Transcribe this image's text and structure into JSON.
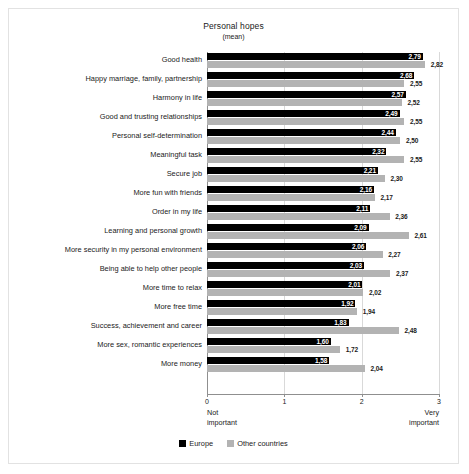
{
  "chart_data": {
    "type": "bar",
    "orientation": "horizontal",
    "title": "Personal hopes",
    "subtitle": "(mean)",
    "xlabel": "",
    "ylabel": "",
    "xlim": [
      0,
      3
    ],
    "xticks": [
      "0",
      "1",
      "2",
      "3"
    ],
    "grid": true,
    "legend_position": "bottom",
    "axis_anchor_low": "Not\nimportant",
    "axis_anchor_low_line1": "Not",
    "axis_anchor_low_line2": "important",
    "axis_anchor_high_line1": "Very",
    "axis_anchor_high_line2": "important",
    "categories": [
      "Good health",
      "Happy marriage, family, partnership",
      "Harmony in life",
      "Good and trusting relationships",
      "Personal self-determination",
      "Meaningful task",
      "Secure job",
      "More fun with friends",
      "Order in my life",
      "Learning and personal growth",
      "More security in my personal environment",
      "Being able to help other people",
      "More time to relax",
      "More free time",
      "Success, achievement and career",
      "More sex, romantic experiences",
      "More money"
    ],
    "series": [
      {
        "name": "Europe",
        "color": "#000000",
        "values": [
          2.79,
          2.68,
          2.57,
          2.49,
          2.44,
          2.32,
          2.21,
          2.16,
          2.11,
          2.09,
          2.06,
          2.03,
          2.01,
          1.92,
          1.83,
          1.6,
          1.58
        ],
        "labels": [
          "2,79",
          "2,68",
          "2,57",
          "2,49",
          "2,44",
          "2,32",
          "2,21",
          "2,16",
          "2,11",
          "2,09",
          "2,06",
          "2,03",
          "2,01",
          "1,92",
          "1,83",
          "1,60",
          "1,58"
        ]
      },
      {
        "name": "Other countries",
        "color": "#b3b3b3",
        "values": [
          2.82,
          2.55,
          2.52,
          2.55,
          2.5,
          2.55,
          2.3,
          2.17,
          2.36,
          2.61,
          2.27,
          2.37,
          2.02,
          1.94,
          2.48,
          1.72,
          2.04
        ],
        "labels": [
          "2,82",
          "2,55",
          "2,52",
          "2,55",
          "2,50",
          "2,55",
          "2,30",
          "2,17",
          "2,36",
          "2,61",
          "2,27",
          "2,37",
          "2,02",
          "1,94",
          "2,48",
          "1,72",
          "2,04"
        ]
      }
    ]
  }
}
